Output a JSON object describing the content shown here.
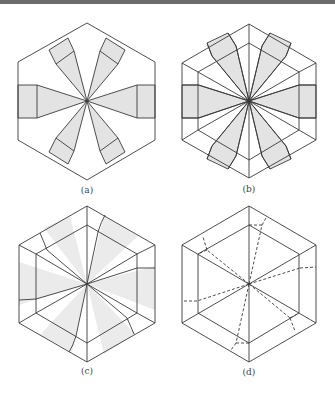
{
  "figure": {
    "panels": [
      {
        "id": "a",
        "label": "(a)",
        "center": [
          87,
          101
        ],
        "shaded": "crisp",
        "lines": "solid"
      },
      {
        "id": "b",
        "label": "(b)",
        "center": [
          249,
          101
        ],
        "shaded": "crisp",
        "lines": "solid"
      },
      {
        "id": "c",
        "label": "(c)",
        "center": [
          87,
          284
        ],
        "shaded": "soft",
        "lines": "solid"
      },
      {
        "id": "d",
        "label": "(d)",
        "center": [
          249,
          284
        ],
        "shaded": "none",
        "lines": "dashed"
      }
    ],
    "colors": {
      "stroke": "#3a3a3a",
      "fill": "#e3e3e3",
      "soft_fill": "#ebebeb",
      "topbar": "#6b6b6b"
    }
  }
}
